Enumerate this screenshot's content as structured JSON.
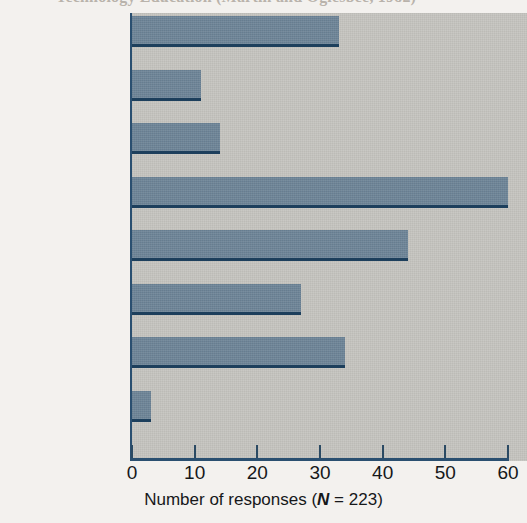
{
  "caption": {
    "text": "Technology Education (Martin and Oglesbee, 1982)"
  },
  "chart_data": {
    "type": "bar",
    "orientation": "horizontal",
    "title": "",
    "categories": [
      "Books",
      "Newspapers",
      "Magazines",
      "Records & Tapes",
      "Television",
      "Radio",
      "Movies",
      "No response"
    ],
    "values": [
      33,
      11,
      14,
      60,
      44,
      27,
      34,
      3
    ],
    "xlabel": "Number of responses (N = 223)",
    "xlabel_prefix": "Number of responses (",
    "xlabel_n": "N",
    "xlabel_suffix": " = 223)",
    "ylabel": "",
    "xlim": [
      0,
      60
    ],
    "xticks": [
      0,
      10,
      20,
      30,
      40,
      50,
      60
    ],
    "xtick_labels": [
      "0",
      "10",
      "20",
      "30",
      "40",
      "50",
      "60"
    ],
    "grid": false,
    "legend": null,
    "n_total": 223,
    "colors": {
      "bar_fill": "#6d8497",
      "bar_edge": "#1d3f5c",
      "plot_background": "#c3c2bd",
      "axis": "#2a4f70",
      "page_background": "#f3f1ee",
      "text": "#16181a"
    }
  }
}
